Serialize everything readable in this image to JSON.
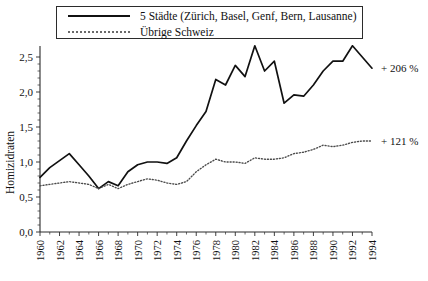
{
  "chart_data": {
    "type": "line",
    "title": "",
    "xlabel": "",
    "ylabel": "Homizidraten",
    "xlim": [
      1960,
      1994
    ],
    "ylim": [
      0.0,
      2.75
    ],
    "grid": false,
    "legend_position": "top-center",
    "y_ticks": [
      "0,0",
      "0,5",
      "1,0",
      "1,5",
      "2,0",
      "2,5"
    ],
    "y_tick_values": [
      0.0,
      0.5,
      1.0,
      1.5,
      2.0,
      2.5
    ],
    "x_ticks": [
      "1960",
      "1962",
      "1964",
      "1966",
      "1968",
      "1970",
      "1972",
      "1974",
      "1976",
      "1978",
      "1980",
      "1982",
      "1984",
      "1986",
      "1988",
      "1990",
      "1992",
      "1994"
    ],
    "x": [
      1960,
      1961,
      1962,
      1963,
      1964,
      1965,
      1966,
      1967,
      1968,
      1969,
      1970,
      1971,
      1972,
      1973,
      1974,
      1975,
      1976,
      1977,
      1978,
      1979,
      1980,
      1981,
      1982,
      1983,
      1984,
      1985,
      1986,
      1987,
      1988,
      1989,
      1990,
      1991,
      1992,
      1993,
      1994
    ],
    "series": [
      {
        "name": "5 Städte (Zürich, Basel, Genf, Bern, Lausanne)",
        "style": "solid",
        "color": "#111111",
        "annotation": "+ 206 %",
        "values": [
          0.78,
          0.92,
          1.02,
          1.12,
          0.96,
          0.8,
          0.62,
          0.72,
          0.66,
          0.86,
          0.96,
          1.0,
          1.0,
          0.98,
          1.06,
          1.3,
          1.52,
          1.72,
          2.18,
          2.1,
          2.38,
          2.22,
          2.66,
          2.3,
          2.44,
          1.84,
          1.96,
          1.94,
          2.1,
          2.3,
          2.44,
          2.44,
          2.66,
          2.5,
          2.34
        ]
      },
      {
        "name": "Übrige Schweiz",
        "style": "dotted",
        "color": "#4a4a4a",
        "annotation": "+ 121 %",
        "values": [
          0.66,
          0.68,
          0.7,
          0.72,
          0.7,
          0.68,
          0.62,
          0.68,
          0.62,
          0.68,
          0.72,
          0.76,
          0.74,
          0.7,
          0.68,
          0.72,
          0.86,
          0.96,
          1.04,
          1.0,
          1.0,
          0.98,
          1.06,
          1.04,
          1.04,
          1.06,
          1.12,
          1.14,
          1.18,
          1.24,
          1.22,
          1.24,
          1.28,
          1.3,
          1.3
        ]
      }
    ]
  },
  "legend": {
    "items": [
      {
        "label": "5 Städte (Zürich, Basel, Genf, Bern, Lausanne)",
        "key": "solid-line-key"
      },
      {
        "label": "Übrige Schweiz",
        "key": "dotted-line-key"
      }
    ]
  },
  "annotations": {
    "city_growth": "+ 206 %",
    "rest_growth": "+ 121 %"
  },
  "axes": {
    "y_title": "Homizidraten"
  }
}
